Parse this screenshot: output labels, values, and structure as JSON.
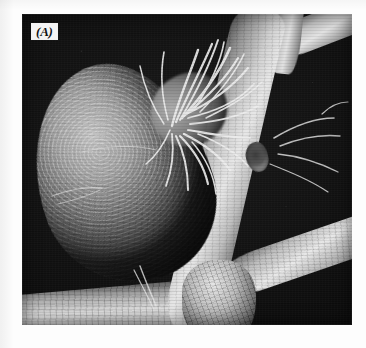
{
  "figure": {
    "panel_label": "(A)",
    "kind": "scanning-electron-micrograph",
    "background_color": "#0b0b0b",
    "page_color": "#ffffff",
    "label_text_color": "#111111",
    "label_box_color": "#f4f4f4"
  },
  "specimen": {
    "nodule_name": "root-nodule",
    "main_root_name": "main-root",
    "upper_branch_name": "upper-branch-root",
    "lower_branch_name": "lower-branch-root",
    "bottom_root_name": "bottom-root",
    "collar_name": "root-collar",
    "lesion_name": "root-lesion",
    "hairs_name": "root-hairs"
  }
}
